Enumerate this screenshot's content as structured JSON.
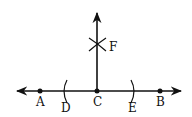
{
  "diagram": {
    "type": "perpendicular-construction",
    "stroke_color": "#111111",
    "background": "#ffffff",
    "line": {
      "y": 91,
      "x_start": 16,
      "x_end": 182,
      "arrows": "both"
    },
    "perpendicular": {
      "x": 97,
      "y_start": 91,
      "y_end": 12,
      "arrow": "up"
    },
    "points": [
      {
        "id": "A",
        "label": "A",
        "x": 40,
        "y": 91,
        "dot": true
      },
      {
        "id": "C",
        "label": "C",
        "x": 97,
        "y": 91,
        "dot": true
      },
      {
        "id": "B",
        "label": "B",
        "x": 160,
        "y": 91,
        "dot": true
      }
    ],
    "arcs": [
      {
        "id": "D",
        "label": "D",
        "x": 65,
        "y": 91
      },
      {
        "id": "E",
        "label": "E",
        "x": 132,
        "y": 91
      }
    ],
    "intersection": {
      "id": "F",
      "label": "F",
      "x": 97,
      "y": 44
    }
  }
}
